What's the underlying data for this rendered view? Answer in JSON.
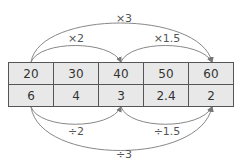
{
  "table": {
    "rows": [
      [
        "20",
        "30",
        "40",
        "50",
        "60"
      ],
      [
        "6",
        "4",
        "3",
        "2.4",
        "2"
      ]
    ]
  },
  "arrows_top": [
    {
      "label": "×3",
      "from_col": 0,
      "to_col": 4
    },
    {
      "label": "×2",
      "from_col": 0,
      "to_col": 2
    },
    {
      "label": "×1.5",
      "from_col": 2,
      "to_col": 4
    }
  ],
  "arrows_bottom": [
    {
      "label": "÷2",
      "from_col": 0,
      "to_col": 2
    },
    {
      "label": "÷1.5",
      "from_col": 2,
      "to_col": 4
    },
    {
      "label": "÷3",
      "from_col": 0,
      "to_col": 4
    }
  ],
  "colors": {
    "cell_fill": "#e8e8e8",
    "border": "#555555",
    "arrow": "#777777"
  }
}
